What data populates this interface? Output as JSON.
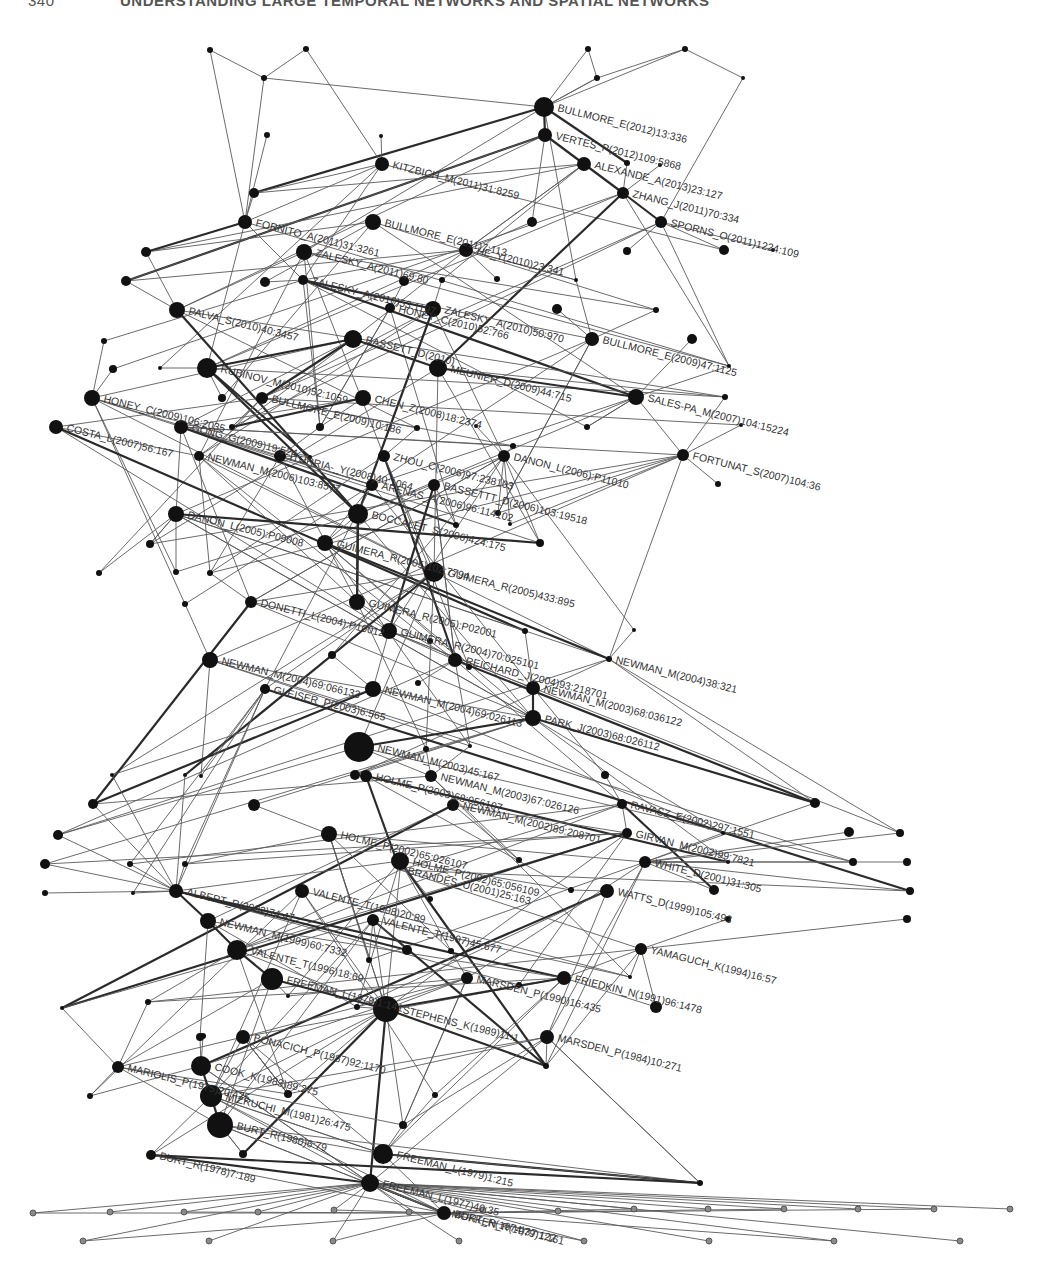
{
  "header": {
    "page_number": "340",
    "title": "UNDERSTANDING LARGE TEMPORAL NETWORKS AND SPATIAL NETWORKS"
  },
  "figure": {
    "type": "citation-network",
    "label_angle_deg": 14,
    "colors": {
      "node": "#111111",
      "leaf_node": "#8a8a8a",
      "edge": "#5a5a5a",
      "thick_edge": "#2a2a2a",
      "label": "#333333"
    },
    "labeled_nodes": [
      {
        "id": "bullmore2012",
        "label": "BULLMORE_E(2012)13:336",
        "x": 544,
        "y": 107,
        "r": 10
      },
      {
        "id": "vertes2012",
        "label": "VERTES_P(2012)109:5868",
        "x": 545,
        "y": 135,
        "r": 7
      },
      {
        "id": "kitzbich2011",
        "label": "KITZBICH_M(2011)31:8259",
        "x": 382,
        "y": 164,
        "r": 7
      },
      {
        "id": "alexande2013",
        "label": "ALEXANDE_A(2013)23:127",
        "x": 584,
        "y": 164,
        "r": 7
      },
      {
        "id": "zhang2011",
        "label": "ZHANG_J(2011)70:334",
        "x": 623,
        "y": 193,
        "r": 6
      },
      {
        "id": "fornito2011",
        "label": "FORNITO_A(2011)31:3261",
        "x": 245,
        "y": 222,
        "r": 7
      },
      {
        "id": "bullmore2011",
        "label": "BULLMORE_E(2011)7:113",
        "x": 373,
        "y": 222,
        "r": 8
      },
      {
        "id": "sporns2011",
        "label": "SPORNS_O(2011)1224:109",
        "x": 661,
        "y": 222,
        "r": 6
      },
      {
        "id": "zalesky2011",
        "label": "ZALESKY_A(2011)69:80",
        "x": 304,
        "y": 252,
        "r": 8
      },
      {
        "id": "he2010",
        "label": "HE_Y(2010)23:341",
        "x": 466,
        "y": 250,
        "r": 7
      },
      {
        "id": "zalesky2010b",
        "label": "ZALESKY_A(2010)53:1197",
        "x": 303,
        "y": 280,
        "r": 5
      },
      {
        "id": "palva2010",
        "label": "PALVA_S(2010)40:3457",
        "x": 177,
        "y": 310,
        "r": 8
      },
      {
        "id": "zalesky2010",
        "label": "ZALESKY_A(2010)50:970",
        "x": 433,
        "y": 309,
        "r": 8
      },
      {
        "id": "rubinov2010",
        "label": "RUBINOV_M(2010)52:1059",
        "x": 207,
        "y": 368,
        "r": 10
      },
      {
        "id": "honey2010",
        "label": "HONEY_C(2010)52:766",
        "x": 390,
        "y": 308,
        "r": 5
      },
      {
        "id": "bassett2010",
        "label": "BASSETT_D(2010)",
        "x": 353,
        "y": 339,
        "r": 9
      },
      {
        "id": "bullmore2009b",
        "label": "BULLMORE_E(2009)47:1125",
        "x": 592,
        "y": 339,
        "r": 7
      },
      {
        "id": "meunier2009",
        "label": "MEUNIER_D(2009)44:715",
        "x": 438,
        "y": 368,
        "r": 9
      },
      {
        "id": "honey2009",
        "label": "HONEY_C(2009)106:2035",
        "x": 92,
        "y": 398,
        "r": 8
      },
      {
        "id": "bullmore2009",
        "label": "BULLMORE_E(2009)10:186",
        "x": 262,
        "y": 398,
        "r": 6
      },
      {
        "id": "chen2008",
        "label": "CHEN_Z(2008)18:2374",
        "x": 363,
        "y": 398,
        "r": 8
      },
      {
        "id": "salespa2007",
        "label": "SALES-PA_M(2007)104:15224",
        "x": 636,
        "y": 397,
        "r": 8
      },
      {
        "id": "gong2009",
        "label": "GONG_G(2009)19:524",
        "x": 181,
        "y": 427,
        "r": 7
      },
      {
        "id": "costa2007",
        "label": "COSTA_L(2007)56:167",
        "x": 56,
        "y": 427,
        "r": 7
      },
      {
        "id": "iturria2008",
        "label": "ITURRIA-_Y(2008)40:1064",
        "x": 280,
        "y": 456,
        "r": 6
      },
      {
        "id": "newman2006",
        "label": "NEWMAN_M(2006)103:8577",
        "x": 199,
        "y": 456,
        "r": 5
      },
      {
        "id": "zhou2006",
        "label": "ZHOU_C(2006)97:238103",
        "x": 384,
        "y": 456,
        "r": 6
      },
      {
        "id": "danon2006",
        "label": "DANON_L(2006):P11010",
        "x": 504,
        "y": 456,
        "r": 6
      },
      {
        "id": "fortunat2007",
        "label": "FORTUNAT_S(2007)104:36",
        "x": 683,
        "y": 455,
        "r": 6
      },
      {
        "id": "arenas2006",
        "label": "ARENAS_A(2006)96:114102",
        "x": 372,
        "y": 485,
        "r": 6
      },
      {
        "id": "bassettt2006",
        "label": "BASSETTT_D(2006)103:19518",
        "x": 434,
        "y": 485,
        "r": 6
      },
      {
        "id": "danon2005",
        "label": "DANON_L(2005):P09008",
        "x": 176,
        "y": 514,
        "r": 8
      },
      {
        "id": "boccalet2006",
        "label": "BOCCALET_S(2006)424:175",
        "x": 358,
        "y": 514,
        "r": 10
      },
      {
        "id": "guimera2005b",
        "label": "GUIMERA_R(2005)102:7794",
        "x": 325,
        "y": 543,
        "r": 8
      },
      {
        "id": "guimera2005",
        "label": "GUIMERA_R(2005)433:895",
        "x": 434,
        "y": 572,
        "r": 10
      },
      {
        "id": "guimera2005c",
        "label": "GUIMERA_R(2005):P02001",
        "x": 357,
        "y": 602,
        "r": 8
      },
      {
        "id": "donetti2004",
        "label": "DONETTI_L(2004):P10012",
        "x": 251,
        "y": 602,
        "r": 6
      },
      {
        "id": "guimera2004",
        "label": "GUIMERA_R(2004)70:025101",
        "x": 389,
        "y": 631,
        "r": 8
      },
      {
        "id": "newman2004c",
        "label": "NEWMAN_M(2004)38:321",
        "x": 609,
        "y": 659,
        "r": 3
      },
      {
        "id": "newman2004b",
        "label": "NEWMAN_M(2004)69:066133",
        "x": 210,
        "y": 660,
        "r": 8
      },
      {
        "id": "reichard2004",
        "label": "REICHARD_J(2004)93:218701",
        "x": 455,
        "y": 660,
        "r": 7
      },
      {
        "id": "newman2003c",
        "label": "NEWMAN_M(2003)68:036122",
        "x": 533,
        "y": 688,
        "r": 7
      },
      {
        "id": "newman2004",
        "label": "NEWMAN_M(2004)69:026113",
        "x": 373,
        "y": 689,
        "r": 8
      },
      {
        "id": "gleiser2003",
        "label": "GLEISER_P(2003)6:565",
        "x": 265,
        "y": 689,
        "r": 5
      },
      {
        "id": "park2003",
        "label": "PARK_J(2003)68:026112",
        "x": 533,
        "y": 718,
        "r": 8
      },
      {
        "id": "newman2003",
        "label": "NEWMAN_M(2003)45:167",
        "x": 359,
        "y": 747,
        "r": 15
      },
      {
        "id": "newman2003b",
        "label": "NEWMAN_M(2003)67:026126",
        "x": 431,
        "y": 776,
        "r": 6
      },
      {
        "id": "holme2003",
        "label": "HOLME_P(2003)68:056107",
        "x": 366,
        "y": 776,
        "r": 6
      },
      {
        "id": "newman2002",
        "label": "NEWMAN_M(2002)89:208701",
        "x": 453,
        "y": 805,
        "r": 6
      },
      {
        "id": "ravasz2002",
        "label": "RAVASZ_E(2002)297:1551",
        "x": 622,
        "y": 804,
        "r": 5
      },
      {
        "id": "holme2002",
        "label": "HOLME_P(2002)65:026107",
        "x": 329,
        "y": 834,
        "r": 8
      },
      {
        "id": "girvan2002",
        "label": "GIRVAN_M(2002)99:7821",
        "x": 627,
        "y": 833,
        "r": 5
      },
      {
        "id": "white2001",
        "label": "WHITE_D(2001)31:305",
        "x": 645,
        "y": 862,
        "r": 6
      },
      {
        "id": "holme2002b",
        "label": "HOLME_P(2002)65:056109",
        "x": 400,
        "y": 861,
        "r": 9
      },
      {
        "id": "brandes2001",
        "label": "BRANDES_U(2001)25:163",
        "x": 400,
        "y": 870,
        "r": 0
      },
      {
        "id": "watts1999",
        "label": "WATTS_D(1999)105:493",
        "x": 607,
        "y": 891,
        "r": 7
      },
      {
        "id": "albert2002",
        "label": "ALBERT_R(2002)74:47",
        "x": 176,
        "y": 891,
        "r": 7
      },
      {
        "id": "valente1998",
        "label": "VALENTE_T(1998)20:89",
        "x": 302,
        "y": 891,
        "r": 7
      },
      {
        "id": "newman1999",
        "label": "NEWMAN_M(1999)60:7332",
        "x": 208,
        "y": 921,
        "r": 8
      },
      {
        "id": "valente1997",
        "label": "VALENTE_T(1997)45:677",
        "x": 373,
        "y": 920,
        "r": 6
      },
      {
        "id": "yamaguch1994",
        "label": "YAMAGUCH_K(1994)16:57",
        "x": 641,
        "y": 949,
        "r": 6
      },
      {
        "id": "valente1996",
        "label": "VALENTE_T(1996)18:69",
        "x": 237,
        "y": 950,
        "r": 10
      },
      {
        "id": "marsden1990",
        "label": "MARSDEN_P(1990)16:435",
        "x": 467,
        "y": 978,
        "r": 6
      },
      {
        "id": "friedkin1991",
        "label": "FRIEDKIN_N(1991)96:1478",
        "x": 564,
        "y": 978,
        "r": 7
      },
      {
        "id": "freeman1979b",
        "label": "FREEMAN_L(1979)1:141",
        "x": 272,
        "y": 979,
        "r": 11
      },
      {
        "id": "stephens1989",
        "label": "STEPHENS_K(1989)11:1",
        "x": 386,
        "y": 1009,
        "r": 13
      },
      {
        "id": "marsden1984",
        "label": "MARSDEN_P(1984)10:271",
        "x": 547,
        "y": 1037,
        "r": 7
      },
      {
        "id": "bonacich1987",
        "label": "BONACICH_P(1987)92:1170",
        "x": 243,
        "y": 1037,
        "r": 7
      },
      {
        "id": "cook1983",
        "label": "COOK_K(1983)89:275",
        "x": 201,
        "y": 1066,
        "r": 10
      },
      {
        "id": "mariolis1975",
        "label": "MARIOLIS_P(1975)20:425",
        "x": 118,
        "y": 1067,
        "r": 6
      },
      {
        "id": "mizruchi1981",
        "label": "MIZRUCHI_M(1981)26:475",
        "x": 211,
        "y": 1096,
        "r": 11
      },
      {
        "id": "burt1980",
        "label": "BURT_R(1980)6:79",
        "x": 220,
        "y": 1125,
        "r": 13
      },
      {
        "id": "freeman1979",
        "label": "FREEMAN_L(1979)1:215",
        "x": 383,
        "y": 1154,
        "r": 10
      },
      {
        "id": "burt1978",
        "label": "BURT_R(1978)7:189",
        "x": 151,
        "y": 1155,
        "r": 5
      },
      {
        "id": "freeman1977",
        "label": "FREEMAN_L(1977)40:35",
        "x": 370,
        "y": 1183,
        "r": 9
      },
      {
        "id": "burt1974",
        "label": "BURT_R(1974)37:122",
        "x": 444,
        "y": 1213,
        "r": 7
      },
      {
        "id": "mokken1979",
        "label": "MOKKEN_R(1979)1:161",
        "x": 444,
        "y": 1213,
        "r": 0
      }
    ],
    "unlabeled_nodes": [
      [
        210,
        50,
        3
      ],
      [
        306,
        49,
        3
      ],
      [
        264,
        78,
        3
      ],
      [
        588,
        49,
        3
      ],
      [
        685,
        49,
        3
      ],
      [
        597,
        78,
        3
      ],
      [
        743,
        78,
        2
      ],
      [
        267,
        135,
        3
      ],
      [
        381,
        136,
        2
      ],
      [
        254,
        193,
        5
      ],
      [
        532,
        222,
        5
      ],
      [
        627,
        163,
        3
      ],
      [
        660,
        165,
        2
      ],
      [
        724,
        250,
        5
      ],
      [
        773,
        250,
        2
      ],
      [
        146,
        252,
        5
      ],
      [
        126,
        281,
        5
      ],
      [
        265,
        282,
        5
      ],
      [
        404,
        281,
        5
      ],
      [
        442,
        280,
        3
      ],
      [
        497,
        279,
        3
      ],
      [
        576,
        280,
        2
      ],
      [
        627,
        251,
        4
      ],
      [
        557,
        309,
        5
      ],
      [
        656,
        310,
        3
      ],
      [
        692,
        339,
        5
      ],
      [
        725,
        397,
        3
      ],
      [
        741,
        425,
        2
      ],
      [
        729,
        366,
        2
      ],
      [
        104,
        341,
        3
      ],
      [
        113,
        369,
        4
      ],
      [
        160,
        368,
        2
      ],
      [
        222,
        398,
        4
      ],
      [
        232,
        427,
        3
      ],
      [
        320,
        427,
        4
      ],
      [
        310,
        457,
        2
      ],
      [
        587,
        427,
        3
      ],
      [
        476,
        426,
        2
      ],
      [
        417,
        428,
        3
      ],
      [
        513,
        446,
        3
      ],
      [
        718,
        484,
        3
      ],
      [
        456,
        525,
        3
      ],
      [
        498,
        513,
        3
      ],
      [
        510,
        524,
        2
      ],
      [
        540,
        543,
        4
      ],
      [
        150,
        544,
        4
      ],
      [
        99,
        573,
        3
      ],
      [
        176,
        572,
        3
      ],
      [
        210,
        573,
        3
      ],
      [
        185,
        604,
        3
      ],
      [
        332,
        655,
        4
      ],
      [
        525,
        631,
        3
      ],
      [
        430,
        641,
        3
      ],
      [
        634,
        630,
        2
      ],
      [
        469,
        667,
        3
      ],
      [
        418,
        683,
        3
      ],
      [
        426,
        749,
        3
      ],
      [
        470,
        746,
        2
      ],
      [
        605,
        775,
        4
      ],
      [
        355,
        775,
        5
      ],
      [
        254,
        805,
        6
      ],
      [
        185,
        775,
        2
      ],
      [
        112,
        775,
        2
      ],
      [
        201,
        776,
        2
      ],
      [
        93,
        804,
        5
      ],
      [
        58,
        835,
        5
      ],
      [
        45,
        864,
        5
      ],
      [
        45,
        893,
        3
      ],
      [
        815,
        803,
        5
      ],
      [
        849,
        832,
        5
      ],
      [
        853,
        862,
        4
      ],
      [
        900,
        833,
        4
      ],
      [
        907,
        862,
        4
      ],
      [
        910,
        891,
        4
      ],
      [
        907,
        919,
        4
      ],
      [
        723,
        833,
        2
      ],
      [
        728,
        862,
        2
      ],
      [
        714,
        890,
        5
      ],
      [
        728,
        919,
        3
      ],
      [
        519,
        860,
        3
      ],
      [
        571,
        890,
        3
      ],
      [
        130,
        864,
        3
      ],
      [
        185,
        864,
        3
      ],
      [
        133,
        893,
        2
      ],
      [
        430,
        899,
        3
      ],
      [
        407,
        950,
        5
      ],
      [
        451,
        951,
        3
      ],
      [
        369,
        960,
        3
      ],
      [
        519,
        985,
        3
      ],
      [
        630,
        977,
        2
      ],
      [
        656,
        1007,
        6
      ],
      [
        357,
        1007,
        3
      ],
      [
        288,
        996,
        2
      ],
      [
        148,
        1002,
        3
      ],
      [
        62,
        1008,
        2
      ],
      [
        200,
        1037,
        4
      ],
      [
        90,
        1096,
        3
      ],
      [
        288,
        1094,
        4
      ],
      [
        435,
        1095,
        3
      ],
      [
        403,
        1125,
        4
      ],
      [
        243,
        1154,
        4
      ],
      [
        700,
        1183,
        3
      ],
      [
        203,
        1036,
        3
      ],
      [
        546,
        1066,
        3
      ]
    ],
    "leaf_nodes": [
      [
        33,
        1213
      ],
      [
        110,
        1212
      ],
      [
        184,
        1212
      ],
      [
        258,
        1212
      ],
      [
        334,
        1210
      ],
      [
        409,
        1212
      ],
      [
        483,
        1210
      ],
      [
        558,
        1211
      ],
      [
        634,
        1209
      ],
      [
        708,
        1209
      ],
      [
        784,
        1209
      ],
      [
        858,
        1209
      ],
      [
        934,
        1209
      ],
      [
        1010,
        1209
      ],
      [
        83,
        1241
      ],
      [
        209,
        1241
      ],
      [
        333,
        1241
      ],
      [
        459,
        1241
      ],
      [
        584,
        1241
      ],
      [
        709,
        1241
      ],
      [
        834,
        1241
      ],
      [
        960,
        1241
      ]
    ]
  }
}
